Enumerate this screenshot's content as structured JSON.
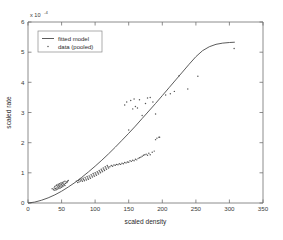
{
  "chart_data": {
    "type": "scatter",
    "title": "",
    "xlabel": "scaled density",
    "ylabel": "scaled rate",
    "y_exponent_label": "x 10",
    "y_exponent_value": "-4",
    "xlim": [
      0,
      350
    ],
    "ylim": [
      0,
      6
    ],
    "xticks": [
      0,
      50,
      100,
      150,
      200,
      250,
      300,
      350
    ],
    "yticks": [
      0,
      1,
      2,
      3,
      4,
      5,
      6
    ],
    "xtick_labels": [
      "0",
      "50",
      "100",
      "150",
      "200",
      "250",
      "300",
      "350"
    ],
    "ytick_labels": [
      "0",
      "1",
      "2",
      "3",
      "4",
      "5",
      "6"
    ],
    "grid": false,
    "legend_position": "upper-left",
    "series": [
      {
        "name": "fitted model",
        "type": "line",
        "marker": "none",
        "color": "#4a4a4a",
        "x": [
          0,
          10,
          20,
          30,
          40,
          50,
          60,
          70,
          80,
          90,
          100,
          110,
          120,
          130,
          140,
          150,
          160,
          170,
          180,
          190,
          200,
          210,
          220,
          230,
          240,
          250,
          260,
          270,
          280,
          290,
          300,
          308
        ],
        "y": [
          0.0,
          0.03,
          0.09,
          0.17,
          0.27,
          0.39,
          0.53,
          0.68,
          0.85,
          1.03,
          1.22,
          1.42,
          1.63,
          1.85,
          2.08,
          2.31,
          2.55,
          2.8,
          3.05,
          3.3,
          3.56,
          3.82,
          4.08,
          4.34,
          4.6,
          4.85,
          5.05,
          5.18,
          5.26,
          5.3,
          5.32,
          5.33
        ]
      },
      {
        "name": "data (pooled)",
        "type": "scatter",
        "marker": ".",
        "color": "#555555",
        "x": [
          36,
          38,
          39,
          40,
          40,
          41,
          42,
          42,
          43,
          43,
          44,
          44,
          45,
          45,
          46,
          46,
          47,
          47,
          48,
          48,
          49,
          49,
          50,
          50,
          51,
          51,
          52,
          52,
          53,
          53,
          54,
          55,
          55,
          56,
          57,
          58,
          59,
          60,
          72,
          74,
          75,
          76,
          77,
          78,
          79,
          80,
          81,
          82,
          83,
          84,
          85,
          86,
          87,
          88,
          89,
          90,
          91,
          92,
          93,
          94,
          95,
          96,
          97,
          98,
          99,
          100,
          101,
          102,
          103,
          104,
          105,
          106,
          107,
          108,
          109,
          110,
          111,
          112,
          113,
          114,
          115,
          116,
          117,
          118,
          119,
          120,
          122,
          124,
          126,
          128,
          130,
          132,
          134,
          136,
          138,
          140,
          142,
          144,
          146,
          148,
          150,
          152,
          154,
          156,
          158,
          160,
          162,
          164,
          166,
          168,
          170,
          172,
          174,
          176,
          178,
          180,
          182,
          185,
          188,
          190,
          192,
          195,
          144,
          147,
          150,
          153,
          156,
          158,
          160,
          163,
          166,
          170,
          175,
          178,
          182,
          186,
          190,
          196,
          205,
          212,
          218,
          225,
          238,
          253,
          307
        ],
        "y": [
          0.47,
          0.44,
          0.5,
          0.42,
          0.55,
          0.48,
          0.44,
          0.58,
          0.5,
          0.6,
          0.46,
          0.56,
          0.52,
          0.62,
          0.48,
          0.58,
          0.54,
          0.64,
          0.5,
          0.6,
          0.56,
          0.66,
          0.52,
          0.62,
          0.58,
          0.68,
          0.55,
          0.65,
          0.6,
          0.7,
          0.62,
          0.58,
          0.72,
          0.65,
          0.7,
          0.68,
          0.72,
          0.75,
          0.72,
          0.68,
          0.75,
          0.7,
          0.78,
          0.73,
          0.8,
          0.76,
          0.72,
          0.82,
          0.78,
          0.74,
          0.85,
          0.8,
          0.76,
          0.88,
          0.83,
          0.79,
          0.9,
          0.86,
          0.82,
          0.94,
          0.9,
          0.86,
          0.98,
          0.93,
          0.89,
          1.0,
          0.96,
          0.92,
          1.04,
          1.0,
          0.96,
          1.08,
          1.04,
          1.0,
          1.12,
          1.08,
          1.04,
          1.16,
          1.12,
          1.08,
          1.2,
          1.16,
          1.12,
          1.24,
          1.2,
          1.16,
          1.2,
          1.24,
          1.22,
          1.26,
          1.25,
          1.28,
          1.27,
          1.3,
          1.28,
          1.32,
          1.3,
          1.34,
          1.33,
          1.36,
          1.35,
          1.4,
          1.38,
          1.42,
          1.4,
          1.45,
          1.43,
          1.48,
          1.5,
          1.52,
          1.55,
          1.58,
          1.6,
          1.62,
          1.58,
          1.65,
          1.6,
          1.68,
          1.72,
          2.1,
          2.15,
          2.18,
          3.25,
          3.35,
          2.42,
          3.4,
          3.12,
          3.45,
          3.2,
          3.15,
          3.42,
          2.9,
          3.3,
          3.48,
          3.5,
          3.35,
          2.95,
          2.18,
          3.58,
          3.62,
          3.7,
          4.22,
          3.78,
          4.2,
          5.12
        ]
      }
    ]
  }
}
